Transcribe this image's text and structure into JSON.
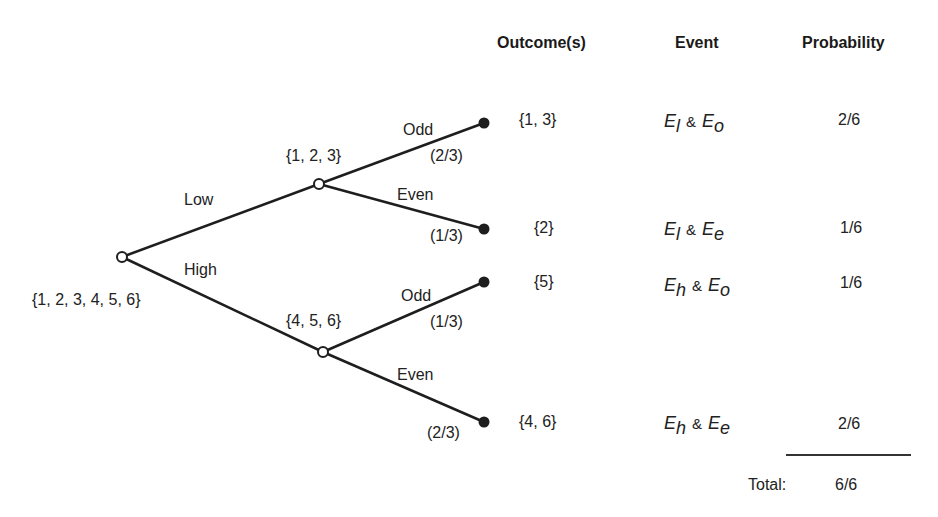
{
  "headers": {
    "outcomes": "Outcome(s)",
    "event": "Event",
    "probability": "Probability"
  },
  "tree": {
    "root": {
      "set": "{1, 2, 3, 4, 5, 6}"
    },
    "branches": [
      {
        "label": "Low",
        "set": "{1, 2, 3}",
        "children": [
          {
            "label": "Odd",
            "prob": "(2/3)",
            "outcome": "{1, 3}"
          },
          {
            "label": "Even",
            "prob": "(1/3)",
            "outcome": "{2}"
          }
        ]
      },
      {
        "label": "High",
        "set": "{4, 5, 6}",
        "children": [
          {
            "label": "Odd",
            "prob": "(1/3)",
            "outcome": "{5}"
          },
          {
            "label": "Even",
            "prob": "(2/3)",
            "outcome": "{4, 6}"
          }
        ]
      }
    ]
  },
  "rows": [
    {
      "outcome": "{1, 3}",
      "e1": "E",
      "e1_sub": "l",
      "amp": "&",
      "e2": "E",
      "e2_sub": "o",
      "probability": "2/6"
    },
    {
      "outcome": "{2}",
      "e1": "E",
      "e1_sub": "l",
      "amp": "&",
      "e2": "E",
      "e2_sub": "e",
      "probability": "1/6"
    },
    {
      "outcome": "{5}",
      "e1": "E",
      "e1_sub": "h",
      "amp": "&",
      "e2": "E",
      "e2_sub": "o",
      "probability": "1/6"
    },
    {
      "outcome": "{4, 6}",
      "e1": "E",
      "e1_sub": "h",
      "amp": "&",
      "e2": "E",
      "e2_sub": "e",
      "probability": "2/6"
    }
  ],
  "total": {
    "label": "Total:",
    "value": "6/6"
  },
  "colors": {
    "line": "#1e1e1e",
    "background": "#ffffff"
  }
}
